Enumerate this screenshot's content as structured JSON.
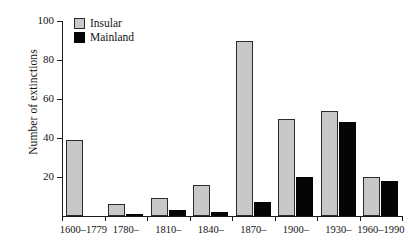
{
  "chart_data": {
    "type": "bar",
    "title": "",
    "subtitle": "",
    "xlabel": "",
    "ylabel": "Number of extinctions",
    "ylim": [
      0,
      100
    ],
    "yticks": [
      0,
      20,
      40,
      60,
      80,
      100
    ],
    "ytick_labels": [
      "",
      "20",
      "40",
      "60",
      "80",
      "100"
    ],
    "grid": false,
    "legend_position": "top-left",
    "categories": [
      "1600–1779",
      "1780–",
      "1810–",
      "1840–",
      "1870–",
      "1900–",
      "1930–",
      "1960–1990"
    ],
    "series": [
      {
        "name": "Insular",
        "color": "#c8c8c8",
        "values": [
          39,
          6,
          9,
          16,
          90,
          50,
          54,
          20
        ]
      },
      {
        "name": "Mainland",
        "color": "#050505",
        "values": [
          0,
          1,
          3,
          2,
          7,
          20,
          48,
          18
        ]
      }
    ]
  },
  "legend": {
    "items": [
      {
        "label": "Insular",
        "color": "#c8c8c8"
      },
      {
        "label": "Mainland",
        "color": "#050505"
      }
    ]
  },
  "axes": {
    "y_title": "Number of extinctions"
  }
}
